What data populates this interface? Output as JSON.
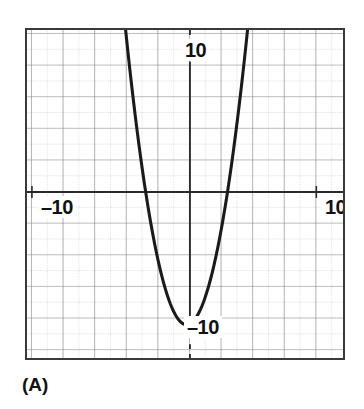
{
  "figure": {
    "caption": "(A)",
    "labels": {
      "y_top": "10",
      "x_left": "–10",
      "x_right": "10",
      "y_bottom": "–10"
    }
  },
  "chart_data": {
    "type": "line",
    "title": "",
    "subtitle": "",
    "xlabel": "",
    "ylabel": "",
    "xlim": [
      -11.8,
      8.2
    ],
    "ylim": [
      -11.4,
      9.3
    ],
    "xticks": [
      -10,
      10
    ],
    "xticklabels": [
      "–10",
      "10"
    ],
    "yticks": [
      -10,
      10
    ],
    "yticklabels": [
      "–10",
      "10"
    ],
    "grid": true,
    "grid_major_step": 2,
    "grid_minor_step": 1,
    "legend": "none",
    "annotations": [
      "(A)"
    ],
    "series": [
      {
        "name": "parabola",
        "equation": "y = 1.2(x + 1.7)^2 - 9.3",
        "vertex": [
          -1.7,
          -9.3
        ],
        "roots": [
          -4.5,
          1.1
        ],
        "y_intercept": -5.8,
        "color": "#1a1a1a",
        "x": [
          -4.95,
          -4.6,
          -4.2,
          -3.8,
          -3.4,
          -3.0,
          -2.6,
          -2.2,
          -1.7,
          -1.2,
          -0.8,
          -0.4,
          0.0,
          0.4,
          0.8,
          1.2,
          1.6,
          2.0,
          2.4,
          2.8,
          3.2
        ],
        "y": [
          3.9,
          1.1,
          -2.0,
          -4.4,
          -6.2,
          -7.5,
          -8.3,
          -8.99,
          -9.3,
          -9.0,
          -8.3,
          -7.4,
          -6.0,
          -4.4,
          -2.5,
          -0.2,
          2.4,
          5.3,
          8.6,
          12.2,
          16.2
        ]
      }
    ],
    "colors": {
      "curve": "#1a1a1a",
      "axis": "#2a2a2a",
      "grid_major": "#8f8f8f",
      "grid_minor": "#bdbdbd",
      "frame": "#3a3a3a",
      "background": "#ffffff"
    }
  }
}
